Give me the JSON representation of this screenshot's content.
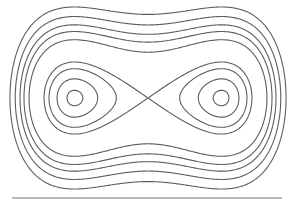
{
  "chart_data": {
    "type": "contour",
    "title": "",
    "function": "V(u,v) = (u^2 - 1)^2 + v^2",
    "u_range": [
      -2.0,
      2.0
    ],
    "v_range": [
      -2.8,
      2.8
    ],
    "minima": [
      [
        -1,
        0
      ],
      [
        1,
        0
      ]
    ],
    "saddle": [
      0,
      0
    ],
    "levels": [
      0.046,
      0.283,
      0.663,
      1.0,
      2.62,
      3.41,
      4.13,
      5.12,
      6.39
    ],
    "separatrix_level": 1.0,
    "colors": {
      "stroke": "#5e5e5e",
      "baseline": "#777777",
      "background": "#ffffff"
    }
  }
}
